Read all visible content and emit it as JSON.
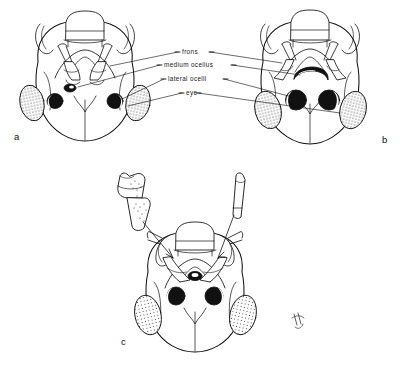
{
  "figure": {
    "type": "scientific-line-drawing",
    "background_color": "#ffffff",
    "ink_color": "#111111"
  },
  "annotations": {
    "labels": [
      {
        "id": "frons",
        "text": "frons",
        "x": 182,
        "y": 52
      },
      {
        "id": "medium-ocellus",
        "text": "medium ocellus",
        "x": 164,
        "y": 65
      },
      {
        "id": "lateral-ocelli",
        "text": "lateral ocelli",
        "x": 168,
        "y": 79
      },
      {
        "id": "eye",
        "text": "eye",
        "x": 186,
        "y": 93
      }
    ]
  },
  "panels": [
    {
      "id": "a",
      "letter": "a",
      "letter_x": 14,
      "letter_y": 131,
      "description": "head capsule with small median ocellus and small lateral ocelli"
    },
    {
      "id": "b",
      "letter": "b",
      "letter_x": 382,
      "letter_y": 134,
      "description": "head capsule with enlarged crescentic median ocellus and large lateral ocelli"
    },
    {
      "id": "c",
      "letter": "c",
      "letter_x": 121,
      "letter_y": 336,
      "description": "head capsule with antennal segment detail callouts"
    }
  ],
  "scale_mark": {
    "id": "scale-mark",
    "x": 292,
    "y": 313
  }
}
